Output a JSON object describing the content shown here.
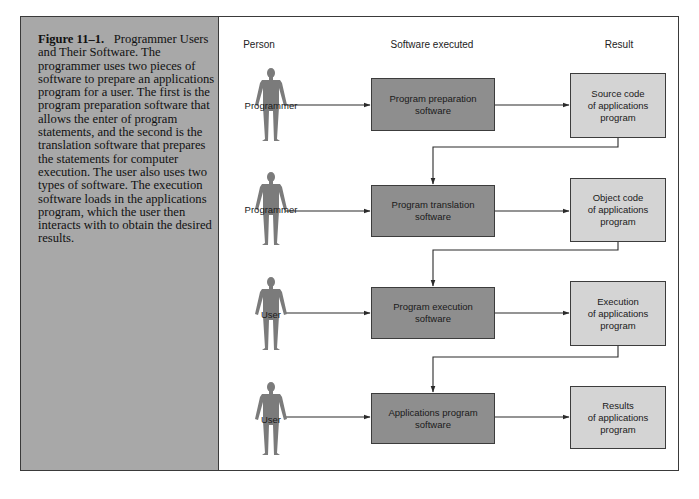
{
  "caption": {
    "figure_label": "Figure 11–1.",
    "title": "Programmer Users and Their Software.",
    "body": "The programmer uses two pieces of software to prepare an applications program for a user. The first is the program preparation software that allows the enter of program statements, and the second is the translation software that prepares the statements for computer execution. The user also uses two types of software. The execution software loads in the applications program, which the user then interacts with to obtain the desired results."
  },
  "columns": {
    "person": "Person",
    "software": "Software executed",
    "result": "Result"
  },
  "rows": [
    {
      "person": "Programmer",
      "software": "Program preparation\nsoftware",
      "result": "Source code\nof applications\nprogram"
    },
    {
      "person": "Programmer",
      "software": "Program translation\nsoftware",
      "result": "Object code\nof applications\nprogram"
    },
    {
      "person": "User",
      "software": "Program execution\nsoftware",
      "result": "Execution\nof applications\nprogram"
    },
    {
      "person": "User",
      "software": "Applications program\nsoftware",
      "result": "Results\nof applications\nprogram"
    }
  ],
  "colors": {
    "caption_bg": "#a8a8a8",
    "software_box": "#8e8e8e",
    "result_box": "#d4d4d4",
    "person_figure": "#7b7b7b",
    "line": "#2a2a2a"
  }
}
